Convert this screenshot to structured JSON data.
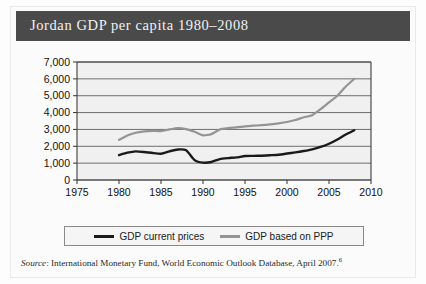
{
  "figure": {
    "title": "Jordan GDP per capita 1980–2008",
    "title_band_color": "#4a4a4a",
    "plot_background": "#f0f0f0",
    "frame_color": "#8a8a8a"
  },
  "source": {
    "label": "Source",
    "text": ": International Monetary Fund, World Economic Outlook Database, April 2007.",
    "footnote": "6"
  },
  "legend": {
    "position": "below-axis",
    "entries": [
      {
        "label": "GDP current prices",
        "color": "#1a1a1a"
      },
      {
        "label": "GDP based on PPP",
        "color": "#949494"
      }
    ]
  },
  "chart_data": {
    "type": "line",
    "title": "Jordan GDP per capita 1980–2008",
    "xlabel": "Year",
    "ylabel": "",
    "xlim": [
      1975,
      2010
    ],
    "ylim": [
      0,
      7000
    ],
    "xticks": [
      1975,
      1980,
      1985,
      1990,
      1995,
      2000,
      2005,
      2010
    ],
    "xtick_labels": [
      "1975",
      "1980",
      "1985",
      "1990",
      "1995",
      "2000",
      "2005",
      "2010"
    ],
    "yticks": [
      0,
      1000,
      2000,
      3000,
      4000,
      5000,
      6000,
      7000
    ],
    "ytick_labels": [
      "0",
      "1,000",
      "2,000",
      "3,000",
      "4,000",
      "5,000",
      "6,000",
      "7,000"
    ],
    "grid": "horizontal",
    "x": [
      1980,
      1981,
      1982,
      1983,
      1984,
      1985,
      1986,
      1987,
      1988,
      1989,
      1990,
      1991,
      1992,
      1993,
      1994,
      1995,
      1996,
      1997,
      1998,
      1999,
      2000,
      2001,
      2002,
      2003,
      2004,
      2005,
      2006,
      2007,
      2008
    ],
    "series": [
      {
        "name": "GDP current prices",
        "color": "#1a1a1a",
        "values": [
          1480,
          1620,
          1700,
          1660,
          1600,
          1560,
          1700,
          1810,
          1760,
          1180,
          1030,
          1070,
          1240,
          1300,
          1340,
          1420,
          1430,
          1440,
          1470,
          1500,
          1570,
          1640,
          1720,
          1820,
          1960,
          2150,
          2400,
          2700,
          2950
        ]
      },
      {
        "name": "GDP based on PPP",
        "color": "#949494",
        "values": [
          2380,
          2640,
          2800,
          2880,
          2920,
          2900,
          3000,
          3080,
          3020,
          2860,
          2650,
          2720,
          3000,
          3080,
          3120,
          3180,
          3220,
          3250,
          3300,
          3360,
          3440,
          3560,
          3720,
          3840,
          4200,
          4600,
          5000,
          5550,
          6000
        ]
      }
    ]
  }
}
